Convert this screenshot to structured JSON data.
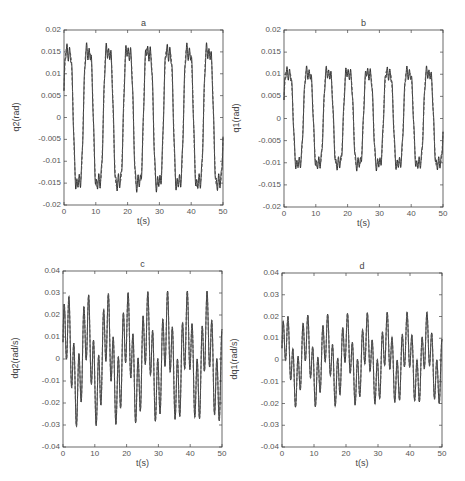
{
  "chart_data": [
    {
      "id": "a",
      "type": "line",
      "title": "a",
      "xlabel": "t(s)",
      "ylabel": "q2(rad)",
      "xlim": [
        0,
        50
      ],
      "ylim": [
        -0.02,
        0.02
      ],
      "xticks": [
        0,
        10,
        20,
        30,
        40,
        50
      ],
      "yticks": [
        -0.02,
        -0.015,
        -0.01,
        -0.005,
        0,
        0.005,
        0.01,
        0.015,
        0.02
      ],
      "ytick_labels": [
        "-0.02",
        "-0.015",
        "-0.01",
        "-0.005",
        "0",
        "0.005",
        "0.01",
        "0.015",
        "0.02"
      ],
      "grid": false,
      "series": [
        {
          "name": "actual",
          "style": "solid",
          "amplitude": 0.0175,
          "period": 6.3,
          "ripple_amplitude": 0.0015,
          "ripple_period": 1.0
        },
        {
          "name": "desired",
          "style": "dashed",
          "amplitude": 0.0175,
          "period": 6.3
        }
      ],
      "peaks_approx": [
        0.018,
        0.0185,
        0.0188,
        0.016,
        0.0188,
        0.018,
        0.0182,
        0.0185
      ],
      "troughs_approx": [
        -0.019,
        -0.0165,
        -0.0185,
        -0.0185,
        -0.017,
        -0.0188,
        -0.017,
        -0.0182
      ]
    },
    {
      "id": "b",
      "type": "line",
      "title": "b",
      "xlabel": "t(s)",
      "ylabel": "q1(rad)",
      "xlim": [
        0,
        50
      ],
      "ylim": [
        -0.02,
        0.02
      ],
      "xticks": [
        0,
        10,
        20,
        30,
        40,
        50
      ],
      "yticks": [
        -0.02,
        -0.015,
        -0.01,
        -0.005,
        0,
        0.005,
        0.01,
        0.015,
        0.02
      ],
      "ytick_labels": [
        "-0.02",
        "-0.015",
        "-0.01",
        "-0.005",
        "0",
        "0.005",
        "0.01",
        "0.015",
        "0.02"
      ],
      "grid": false,
      "series": [
        {
          "name": "actual",
          "style": "solid",
          "amplitude": 0.012,
          "period": 6.3,
          "ripple_amplitude": 0.0012,
          "ripple_period": 1.0
        },
        {
          "name": "desired",
          "style": "dashed",
          "amplitude": 0.012,
          "period": 6.3
        }
      ],
      "peaks_approx": [
        0.012,
        0.0125,
        0.0128,
        0.0105,
        0.0128,
        0.012,
        0.0118,
        0.0125
      ],
      "troughs_approx": [
        -0.0133,
        -0.0115,
        -0.0128,
        -0.0128,
        -0.013,
        -0.0118,
        -0.0125
      ]
    },
    {
      "id": "c",
      "type": "line",
      "title": "c",
      "xlabel": "t(s)",
      "ylabel": "dq2(rad/s)",
      "xlim": [
        0,
        50
      ],
      "ylim": [
        -0.04,
        0.04
      ],
      "xticks": [
        0,
        10,
        20,
        30,
        40,
        50
      ],
      "yticks": [
        -0.04,
        -0.03,
        -0.02,
        -0.01,
        0,
        0.01,
        0.02,
        0.03,
        0.04
      ],
      "ytick_labels": [
        "-0.04",
        "-0.03",
        "-0.02",
        "-0.01",
        "0",
        "0.01",
        "0.02",
        "0.03",
        "0.04"
      ],
      "grid": false,
      "series": [
        {
          "name": "actual",
          "style": "solid",
          "slow_amplitude": 0.0155,
          "slow_period": 6.3,
          "fast_amplitude": 0.0155,
          "fast_period": 1.55
        },
        {
          "name": "desired",
          "style": "dashed",
          "slow_amplitude": 0.0155,
          "slow_period": 6.3,
          "fast_amplitude": 0.0155,
          "fast_period": 1.55
        }
      ],
      "max_approx": 0.031,
      "min_approx": -0.03
    },
    {
      "id": "d",
      "type": "line",
      "title": "d",
      "xlabel": "t(s)",
      "ylabel": "dq1(rad/s)",
      "xlim": [
        0,
        50
      ],
      "ylim": [
        -0.04,
        0.04
      ],
      "xticks": [
        0,
        10,
        20,
        30,
        40,
        50
      ],
      "yticks": [
        -0.04,
        -0.03,
        -0.02,
        -0.01,
        0,
        0.01,
        0.02,
        0.03,
        0.04
      ],
      "ytick_labels": [
        "-0.04",
        "-0.03",
        "-0.02",
        "-0.01",
        "0",
        "0.01",
        "0.02",
        "0.03",
        "0.04"
      ],
      "grid": false,
      "series": [
        {
          "name": "actual",
          "style": "solid",
          "slow_amplitude": 0.011,
          "slow_period": 6.3,
          "fast_amplitude": 0.011,
          "fast_period": 1.55
        },
        {
          "name": "desired",
          "style": "dashed",
          "slow_amplitude": 0.011,
          "slow_period": 6.3,
          "fast_amplitude": 0.011,
          "fast_period": 1.55
        }
      ],
      "max_approx": 0.022,
      "min_approx": -0.023
    }
  ],
  "layout": {
    "panels": {
      "a": {
        "left": 64,
        "top": 30,
        "width": 159,
        "height": 175
      },
      "b": {
        "left": 284,
        "top": 30,
        "width": 159,
        "height": 177
      },
      "c": {
        "left": 63,
        "top": 271,
        "width": 159,
        "height": 176
      },
      "d": {
        "left": 282,
        "top": 273,
        "width": 160,
        "height": 174
      }
    }
  }
}
